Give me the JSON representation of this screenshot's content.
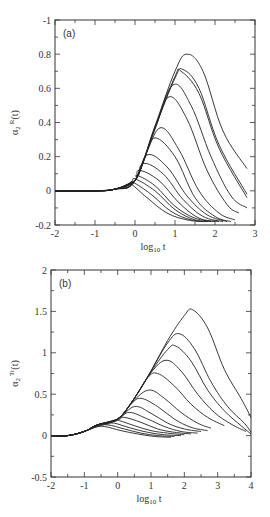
{
  "chart_data": [
    {
      "type": "line",
      "panel_label": "(a)",
      "title": "",
      "xlabel": "log10 t",
      "xlabel_main": "log",
      "xlabel_sub": "10",
      "xlabel_tail": " t",
      "ylabel": "α2 R(t)",
      "ylabel_main": "α",
      "ylabel_sub": "2",
      "ylabel_sup": "R",
      "ylabel_tail": "(t)",
      "xlim": [
        -2,
        3
      ],
      "ylim": [
        -0.2,
        1
      ],
      "xticks": [
        -2,
        -1,
        0,
        1,
        2,
        3
      ],
      "xtick_labels": [
        "-2",
        "-1",
        "0",
        "1",
        "2",
        "3"
      ],
      "yticks": [
        -0.2,
        0,
        0.2,
        0.4,
        0.6,
        0.8,
        1
      ],
      "ytick_labels": [
        "-0.2",
        "0",
        "0.2",
        "0.4",
        "0.6",
        "0.8",
        "-1"
      ],
      "grid": false,
      "legend": "none",
      "series": [
        {
          "name": "curve-1",
          "x": [
            -2,
            -1,
            -0.5,
            0,
            0.5,
            1,
            1.3,
            1.7,
            2.2,
            2.8
          ],
          "y": [
            0,
            0,
            0.01,
            0.06,
            0.38,
            0.7,
            0.8,
            0.7,
            0.35,
            0.13
          ]
        },
        {
          "name": "curve-2",
          "x": [
            -2,
            -1,
            -0.5,
            0,
            0.5,
            1,
            1.2,
            1.6,
            2.1,
            2.8
          ],
          "y": [
            0,
            0,
            0.01,
            0.06,
            0.37,
            0.66,
            0.71,
            0.6,
            0.27,
            -0.02
          ]
        },
        {
          "name": "curve-3",
          "x": [
            -2,
            -1,
            -0.5,
            0,
            0.5,
            1,
            1.15,
            1.6,
            2.1,
            2.8
          ],
          "y": [
            0,
            0,
            0.01,
            0.06,
            0.37,
            0.67,
            0.7,
            0.57,
            0.25,
            -0.04
          ]
        },
        {
          "name": "curve-4",
          "x": [
            -2,
            -1,
            -0.5,
            0,
            0.5,
            0.95,
            1.4,
            1.9,
            2.4,
            2.8
          ],
          "y": [
            0,
            0,
            0.01,
            0.06,
            0.37,
            0.62,
            0.5,
            0.2,
            -0.03,
            -0.1
          ]
        },
        {
          "name": "curve-5",
          "x": [
            -2,
            -1,
            -0.5,
            0,
            0.5,
            0.85,
            1.3,
            1.8,
            2.3,
            2.6
          ],
          "y": [
            0,
            0,
            0.01,
            0.06,
            0.36,
            0.55,
            0.42,
            0.12,
            -0.08,
            -0.13
          ]
        },
        {
          "name": "curve-6",
          "x": [
            -2,
            -1,
            -0.5,
            0,
            0.3,
            0.65,
            1.1,
            1.6,
            2.1,
            2.5
          ],
          "y": [
            0,
            0,
            0.01,
            0.06,
            0.23,
            0.37,
            0.24,
            0.0,
            -0.13,
            -0.17
          ]
        },
        {
          "name": "curve-7",
          "x": [
            -2,
            -1,
            -0.5,
            0,
            0.25,
            0.5,
            1.0,
            1.5,
            2.0,
            2.4
          ],
          "y": [
            0,
            0,
            0.01,
            0.06,
            0.2,
            0.31,
            0.2,
            -0.04,
            -0.15,
            -0.18
          ]
        },
        {
          "name": "curve-8",
          "x": [
            -2,
            -1,
            -0.5,
            0,
            0.3,
            0.8,
            1.3,
            1.8,
            2.3
          ],
          "y": [
            0,
            0,
            0.01,
            0.06,
            0.21,
            0.14,
            -0.03,
            -0.14,
            -0.18
          ]
        },
        {
          "name": "curve-9",
          "x": [
            -2,
            -1,
            -0.5,
            0,
            0.2,
            0.7,
            1.2,
            1.7,
            2.2
          ],
          "y": [
            0,
            0,
            0.01,
            0.06,
            0.16,
            0.1,
            -0.05,
            -0.15,
            -0.18
          ]
        },
        {
          "name": "curve-10",
          "x": [
            -2,
            -1,
            -0.5,
            0,
            0.1,
            0.6,
            1.1,
            1.6,
            2.1
          ],
          "y": [
            0,
            0,
            0.01,
            0.06,
            0.12,
            0.06,
            -0.07,
            -0.16,
            -0.18
          ]
        },
        {
          "name": "curve-11",
          "x": [
            -2,
            -1,
            -0.5,
            0,
            0.05,
            0.5,
            1.0,
            1.5,
            2.0
          ],
          "y": [
            0,
            0,
            0.01,
            0.06,
            0.09,
            0.03,
            -0.09,
            -0.16,
            -0.18
          ]
        },
        {
          "name": "curve-12",
          "x": [
            -2,
            -1,
            -0.5,
            -0.1,
            0,
            0.5,
            1.0,
            1.5,
            1.9
          ],
          "y": [
            0,
            0,
            0.01,
            0.05,
            0.07,
            0.0,
            -0.11,
            -0.17,
            -0.18
          ]
        },
        {
          "name": "curve-13",
          "x": [
            -2,
            -1,
            -0.5,
            -0.15,
            -0.05,
            0.4,
            0.9,
            1.4,
            1.8
          ],
          "y": [
            0,
            0,
            0.01,
            0.04,
            0.05,
            -0.02,
            -0.12,
            -0.17,
            -0.18
          ]
        },
        {
          "name": "curve-14",
          "x": [
            -2,
            -1,
            -0.5,
            -0.2,
            -0.1,
            0.3,
            0.8,
            1.3,
            1.7
          ],
          "y": [
            0,
            0,
            0.01,
            0.03,
            0.04,
            -0.04,
            -0.13,
            -0.17,
            -0.18
          ]
        }
      ]
    },
    {
      "type": "line",
      "panel_label": "(b)",
      "title": "",
      "xlabel": "log10 t",
      "xlabel_main": "log",
      "xlabel_sub": "10",
      "xlabel_tail": " t",
      "ylabel": "α2 Tr(t)",
      "ylabel_main": "α",
      "ylabel_sub": "2",
      "ylabel_sup": "Tr",
      "ylabel_tail": "(t)",
      "xlim": [
        -2,
        4
      ],
      "ylim": [
        -0.5,
        2
      ],
      "xticks": [
        -2,
        -1,
        0,
        1,
        2,
        3,
        4
      ],
      "xtick_labels": [
        "-2",
        "-1",
        "0",
        "1",
        "2",
        "3",
        "4"
      ],
      "yticks": [
        -0.5,
        0,
        0.5,
        1,
        1.5,
        2
      ],
      "ytick_labels": [
        "-0.5",
        "0",
        "0.5",
        "1",
        "1.5",
        "2"
      ],
      "grid": false,
      "legend": "none",
      "series": [
        {
          "name": "curve-1",
          "x": [
            -2,
            -1.5,
            -1,
            -0.6,
            0,
            0.5,
            1,
            1.5,
            2,
            2.25,
            2.7,
            3.2,
            3.7,
            4
          ],
          "y": [
            0,
            0,
            0.05,
            0.13,
            0.2,
            0.45,
            0.78,
            1.15,
            1.45,
            1.52,
            1.3,
            0.8,
            0.45,
            0.22
          ]
        },
        {
          "name": "curve-2",
          "x": [
            -2,
            -1.5,
            -1,
            -0.6,
            0,
            0.5,
            1,
            1.5,
            1.85,
            2.3,
            2.8,
            3.3,
            3.8,
            4
          ],
          "y": [
            0,
            0,
            0.05,
            0.13,
            0.2,
            0.45,
            0.78,
            1.12,
            1.23,
            1.05,
            0.65,
            0.35,
            0.15,
            0.04
          ]
        },
        {
          "name": "curve-3",
          "x": [
            -2,
            -1.5,
            -1,
            -0.6,
            0,
            0.5,
            1,
            1.5,
            1.75,
            2.2,
            2.7,
            3.2,
            3.7,
            4
          ],
          "y": [
            0,
            0,
            0.05,
            0.13,
            0.2,
            0.45,
            0.77,
            1.04,
            1.08,
            0.9,
            0.55,
            0.3,
            0.12,
            0.02
          ]
        },
        {
          "name": "curve-4",
          "x": [
            -2,
            -1.5,
            -1,
            -0.6,
            0,
            0.5,
            1,
            1.45,
            1.9,
            2.4,
            2.9,
            3.4,
            3.85
          ],
          "y": [
            0,
            0,
            0.05,
            0.13,
            0.2,
            0.45,
            0.76,
            0.91,
            0.78,
            0.5,
            0.28,
            0.14,
            0.05
          ]
        },
        {
          "name": "curve-5",
          "x": [
            -2,
            -1.5,
            -1,
            -0.6,
            0,
            0.5,
            0.9,
            1.2,
            1.7,
            2.2,
            2.7,
            3.2
          ],
          "y": [
            0,
            0,
            0.05,
            0.13,
            0.2,
            0.45,
            0.7,
            0.75,
            0.6,
            0.38,
            0.22,
            0.12
          ]
        },
        {
          "name": "curve-6",
          "x": [
            -2,
            -1.5,
            -1,
            -0.6,
            0,
            0.5,
            0.95,
            1.4,
            1.9,
            2.4,
            2.8
          ],
          "y": [
            0,
            0,
            0.05,
            0.13,
            0.2,
            0.43,
            0.55,
            0.45,
            0.28,
            0.15,
            0.09
          ]
        },
        {
          "name": "curve-7",
          "x": [
            -2,
            -1.5,
            -1,
            -0.6,
            0,
            0.4,
            0.7,
            1.2,
            1.7,
            2.2,
            2.7
          ],
          "y": [
            0,
            0,
            0.05,
            0.13,
            0.2,
            0.38,
            0.45,
            0.35,
            0.2,
            0.1,
            0.06
          ]
        },
        {
          "name": "curve-8",
          "x": [
            -2,
            -1.5,
            -1,
            -0.6,
            0,
            0.5,
            1.0,
            1.5,
            2.0,
            2.5
          ],
          "y": [
            0,
            0,
            0.05,
            0.13,
            0.2,
            0.35,
            0.27,
            0.15,
            0.08,
            0.05
          ]
        },
        {
          "name": "curve-9",
          "x": [
            -2,
            -1.5,
            -1,
            -0.6,
            0,
            0.35,
            0.9,
            1.4,
            1.9,
            2.4
          ],
          "y": [
            0,
            0,
            0.05,
            0.13,
            0.2,
            0.28,
            0.2,
            0.11,
            0.05,
            0.03
          ]
        },
        {
          "name": "curve-10",
          "x": [
            -2,
            -1.5,
            -1,
            -0.6,
            0,
            0.2,
            0.7,
            1.2,
            1.7,
            2.2
          ],
          "y": [
            0,
            0,
            0.05,
            0.13,
            0.19,
            0.22,
            0.16,
            0.08,
            0.04,
            0.02
          ]
        },
        {
          "name": "curve-11",
          "x": [
            -2,
            -1.5,
            -1,
            -0.6,
            -0.1,
            0.05,
            0.5,
            1.0,
            1.5,
            2.0
          ],
          "y": [
            0,
            0,
            0.05,
            0.13,
            0.17,
            0.18,
            0.12,
            0.06,
            0.03,
            0.01
          ]
        },
        {
          "name": "curve-12",
          "x": [
            -2,
            -1.5,
            -1,
            -0.6,
            -0.3,
            -0.1,
            0.4,
            0.9,
            1.4,
            1.9
          ],
          "y": [
            0,
            0,
            0.05,
            0.12,
            0.14,
            0.15,
            0.09,
            0.04,
            0.01,
            0.0
          ]
        },
        {
          "name": "curve-13",
          "x": [
            -2,
            -1.5,
            -1,
            -0.6,
            -0.3,
            0.2,
            0.7,
            1.2,
            1.7
          ],
          "y": [
            0,
            0,
            0.05,
            0.11,
            0.13,
            0.08,
            0.03,
            0.0,
            -0.01
          ]
        },
        {
          "name": "curve-14",
          "x": [
            -2,
            -1.5,
            -1,
            -0.7,
            -0.4,
            0.1,
            0.6,
            1.1,
            1.6
          ],
          "y": [
            0,
            0,
            0.05,
            0.1,
            0.11,
            0.06,
            0.02,
            -0.01,
            -0.02
          ]
        }
      ]
    }
  ]
}
